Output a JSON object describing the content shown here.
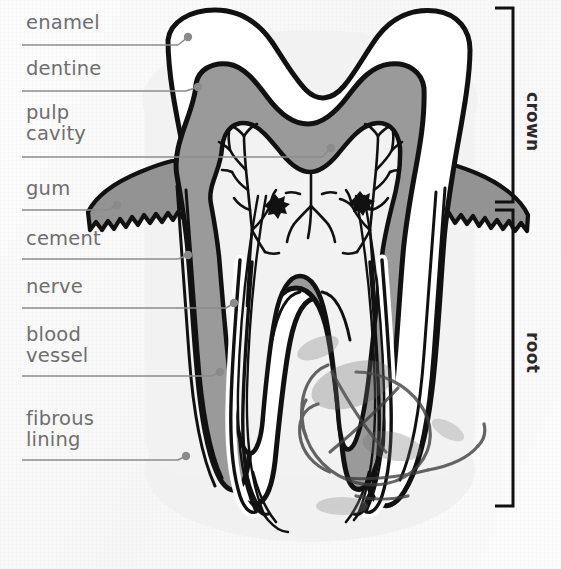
{
  "figure": {
    "kind": "anatomical-diagram",
    "background_color": "#fbfbfb",
    "ink_color": "#111111",
    "label_text_color": "#6e6e6e",
    "leader_line_color": "#8b8b8b",
    "dentine_fill": "#9a9a9a",
    "enamel_fill": "#ffffff",
    "pulp_fill": "#f2f2f2",
    "gum_fill": "#939393",
    "halo_fill": "#f2f2f2"
  },
  "labels": [
    {
      "id": "enamel",
      "text": "enamel",
      "x": 26,
      "y": 12,
      "rule_y": 45,
      "rule_x1": 22,
      "rule_x2": 178,
      "dot_x": 188,
      "dot_y": 37
    },
    {
      "id": "dentine",
      "text": "dentine",
      "x": 26,
      "y": 58,
      "rule_y": 91,
      "rule_x1": 22,
      "rule_x2": 186,
      "dot_x": 198,
      "dot_y": 87
    },
    {
      "id": "pulp-cavity",
      "text": "pulp\ncavity",
      "x": 26,
      "y": 102,
      "rule_y": 157,
      "rule_x1": 22,
      "rule_x2": 322,
      "dot_x": 331,
      "dot_y": 148
    },
    {
      "id": "gum",
      "text": "gum",
      "x": 26,
      "y": 178,
      "rule_y": 210,
      "rule_x1": 22,
      "rule_x2": 108,
      "dot_x": 117,
      "dot_y": 205
    },
    {
      "id": "cement",
      "text": "cement",
      "x": 26,
      "y": 228,
      "rule_y": 259,
      "rule_x1": 22,
      "rule_x2": 178,
      "dot_x": 188,
      "dot_y": 255
    },
    {
      "id": "nerve",
      "text": "nerve",
      "x": 26,
      "y": 276,
      "rule_y": 308,
      "rule_x1": 22,
      "rule_x2": 226,
      "dot_x": 234,
      "dot_y": 303
    },
    {
      "id": "blood-vessel",
      "text": "blood\nvessel",
      "x": 26,
      "y": 324,
      "rule_y": 376,
      "rule_x1": 22,
      "rule_x2": 212,
      "dot_x": 220,
      "dot_y": 372
    },
    {
      "id": "fibrous-lining",
      "text": "fibrous\nlining",
      "x": 26,
      "y": 408,
      "rule_y": 460,
      "rule_x1": 22,
      "rule_x2": 178,
      "dot_x": 186,
      "dot_y": 456
    }
  ],
  "side_brackets": [
    {
      "id": "crown",
      "text": "crown",
      "top": 8,
      "bottom": 202,
      "x": 513,
      "label_x": 543,
      "label_y": 92
    },
    {
      "id": "root",
      "text": "root",
      "top": 210,
      "bottom": 506,
      "x": 513,
      "label_x": 543,
      "label_y": 332
    }
  ],
  "annotations": {
    "scribble_present": true,
    "smudge_present": true
  }
}
